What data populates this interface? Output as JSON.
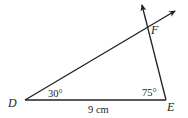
{
  "diagram": {
    "type": "triangle",
    "vertices": {
      "D": {
        "label": "D"
      },
      "E": {
        "label": "E"
      },
      "F": {
        "label": "F"
      }
    },
    "angles": {
      "D": "30°",
      "E": "75°"
    },
    "sides": {
      "DE": "9 cm"
    },
    "rays": [
      "DF extended with arrow",
      "EF extended with arrow"
    ],
    "colors": {
      "stroke": "#231f20",
      "background": "#ffffff"
    }
  }
}
